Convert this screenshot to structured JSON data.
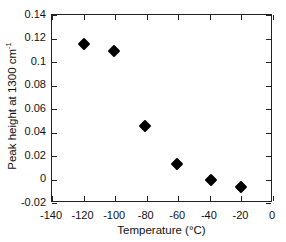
{
  "chart_data": {
    "type": "scatter",
    "title": "",
    "xlabel": "Temperature (°C)",
    "ylabel": "Peak height at 1300 cm",
    "ylabel_superscript": "-1",
    "xlim": [
      -140,
      0
    ],
    "ylim": [
      -0.02,
      0.14
    ],
    "grid": false,
    "legend": "none",
    "marker": "filled-diamond",
    "marker_color": "#000000",
    "xticks": [
      "-140",
      "-120",
      "-100",
      "-80",
      "-60",
      "-40",
      "-20",
      "0"
    ],
    "xtick_values": [
      -140,
      -120,
      -100,
      -80,
      -60,
      -40,
      -20,
      0
    ],
    "yticks": [
      "0.14",
      "0.12",
      "0.1",
      "0.08",
      "0.06",
      "0.04",
      "0.02",
      "0",
      "-0.02"
    ],
    "ytick_values": [
      0.14,
      0.12,
      0.1,
      0.08,
      0.06,
      0.04,
      0.02,
      0,
      -0.02
    ],
    "x": [
      -120,
      -101,
      -81,
      -61,
      -39,
      -20
    ],
    "values": [
      0.115,
      0.1095,
      0.0452,
      0.0133,
      -0.0008,
      -0.006
    ],
    "points": [
      {
        "x": -120,
        "y": 0.115
      },
      {
        "x": -101,
        "y": 0.1095
      },
      {
        "x": -81,
        "y": 0.0452
      },
      {
        "x": -61,
        "y": 0.0133
      },
      {
        "x": -39,
        "y": -0.0008
      },
      {
        "x": -20,
        "y": -0.006
      }
    ]
  }
}
